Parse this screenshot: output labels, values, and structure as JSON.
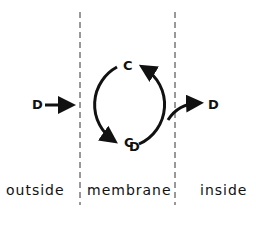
{
  "diagram": {
    "regions": [
      {
        "label": "outside"
      },
      {
        "label": "membrane"
      },
      {
        "label": "inside"
      }
    ],
    "nodes": {
      "d_outside": "D",
      "carrier": "C",
      "complex_c": "C",
      "complex_d": "D",
      "d_inside": "D"
    },
    "colors": {
      "ink": "#111111",
      "background": "#ffffff"
    }
  }
}
